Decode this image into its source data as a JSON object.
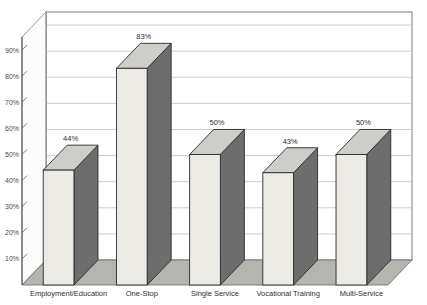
{
  "chart_data": {
    "type": "bar",
    "title": "",
    "subtitle": "",
    "xlabel": "",
    "ylabel": "",
    "categories": [
      "Employment/Education",
      "One-Stop",
      "Single Service",
      "Vocational Training",
      "Multi-Service"
    ],
    "values": [
      44,
      83,
      50,
      43,
      50
    ],
    "value_labels": [
      "44%",
      "83%",
      "50%",
      "43%",
      "50%"
    ],
    "ylim": [
      0,
      95
    ],
    "ytick_values": [
      10,
      20,
      30,
      40,
      50,
      60,
      70,
      80,
      90
    ],
    "ytick_labels": [
      "10%",
      "20%",
      "30%",
      "40%",
      "50%",
      "60%",
      "70%",
      "80%",
      "90%"
    ],
    "grid": true,
    "grid_axis": "y",
    "legend": false,
    "legend_position": "none",
    "three_d": true,
    "annotations": []
  },
  "style": {
    "bar_front_color": "#eceae5",
    "bar_side_color": "#6d6d6d",
    "bar_top_color": "#cfcdc8",
    "bar_outline_color": "#2b2b2b",
    "floor_color": "#b6b4af",
    "wall_color": "#ffffff",
    "grid_color": "#b9b9b9",
    "axis_color": "#4d4d4d",
    "text_color": "#2e2e2e",
    "tick_text_color": "#4a4a4a",
    "background_color": "#ffffff"
  }
}
